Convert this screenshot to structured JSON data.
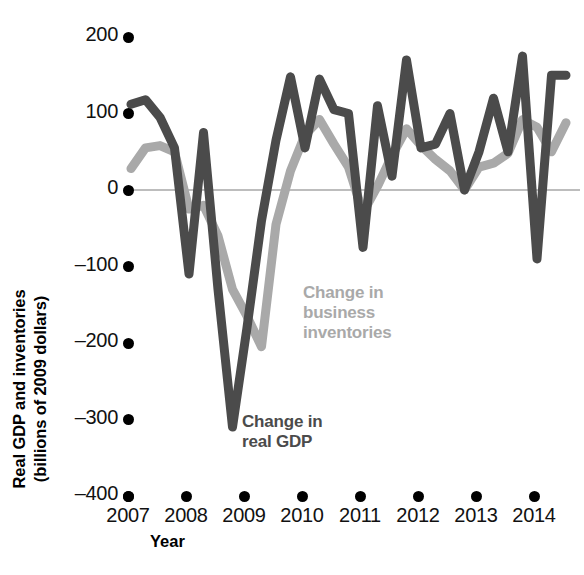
{
  "axes": {
    "y_title_line1": "Real GDP and inventories",
    "y_title_line2": "(billions of 2009 dollars)",
    "x_title": "Year",
    "y_ticks": [
      "200",
      "100",
      "0",
      "–100",
      "–200",
      "–300",
      "–400"
    ],
    "x_ticks": [
      "2007",
      "2008",
      "2009",
      "2010",
      "2011",
      "2012",
      "2013",
      "2014"
    ]
  },
  "annotations": {
    "inventories_line1": "Change in",
    "inventories_line2": "business",
    "inventories_line3": "inventories",
    "gdp_line1": "Change in",
    "gdp_line2": "real GDP"
  },
  "colors": {
    "gdp": "#4b4b4b",
    "inventories": "#a9a9a9",
    "zero_line": "#bdbdbd",
    "text": "#111111"
  },
  "chart_data": {
    "type": "line",
    "title": "",
    "xlabel": "Year",
    "ylabel": "Real GDP and inventories (billions of 2009 dollars)",
    "xlim": [
      2007.0,
      2014.6
    ],
    "ylim": [
      -400,
      200
    ],
    "yticks": [
      200,
      100,
      0,
      -100,
      -200,
      -300,
      -400
    ],
    "xticks": [
      2007,
      2008,
      2009,
      2010,
      2011,
      2012,
      2013,
      2014
    ],
    "grid": false,
    "zero_line": true,
    "legend_position": "inline-annotation",
    "series": [
      {
        "name": "Change in real GDP",
        "color": "#4b4b4b",
        "x": [
          2007.0,
          2007.25,
          2007.5,
          2007.75,
          2008.0,
          2008.25,
          2008.5,
          2008.75,
          2009.0,
          2009.25,
          2009.5,
          2009.75,
          2010.0,
          2010.25,
          2010.5,
          2010.75,
          2011.0,
          2011.25,
          2011.5,
          2011.75,
          2012.0,
          2012.25,
          2012.5,
          2012.75,
          2013.0,
          2013.25,
          2013.5,
          2013.75,
          2014.0,
          2014.25,
          2014.5
        ],
        "y": [
          112,
          118,
          95,
          55,
          -110,
          75,
          -130,
          -310,
          -180,
          -40,
          65,
          148,
          55,
          145,
          105,
          100,
          -75,
          110,
          18,
          170,
          55,
          60,
          100,
          0,
          50,
          120,
          50,
          175,
          -90,
          150,
          150
        ]
      },
      {
        "name": "Change in business inventories",
        "color": "#a9a9a9",
        "x": [
          2007.0,
          2007.25,
          2007.5,
          2007.75,
          2008.0,
          2008.25,
          2008.5,
          2008.75,
          2009.0,
          2009.25,
          2009.5,
          2009.75,
          2010.0,
          2010.25,
          2010.5,
          2010.75,
          2011.0,
          2011.25,
          2011.5,
          2011.75,
          2012.0,
          2012.25,
          2012.5,
          2012.75,
          2013.0,
          2013.25,
          2013.5,
          2013.75,
          2014.0,
          2014.25,
          2014.5
        ],
        "y": [
          28,
          55,
          58,
          50,
          -25,
          -20,
          -60,
          -130,
          -165,
          -205,
          -45,
          25,
          72,
          92,
          60,
          30,
          -30,
          5,
          45,
          80,
          58,
          40,
          25,
          0,
          30,
          35,
          48,
          92,
          82,
          50,
          88
        ]
      }
    ]
  }
}
